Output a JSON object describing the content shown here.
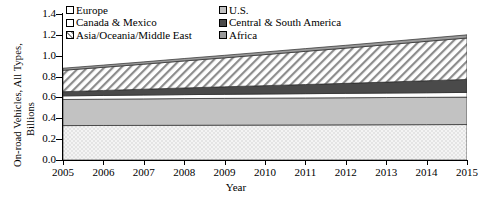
{
  "chart_data": {
    "type": "area",
    "title": "",
    "xlabel": "Year",
    "ylabel": "On-road Vehicles, All Types, Billions",
    "ylabel_line1": "On-road Vehicles, All Types,",
    "ylabel_line2": "Billions",
    "ylim": [
      0.0,
      1.4
    ],
    "yticks": [
      "0.0",
      "0.2",
      "0.4",
      "0.6",
      "0.8",
      "1.0",
      "1.2",
      "1.4"
    ],
    "ytick_values": [
      0.0,
      0.2,
      0.4,
      0.6,
      0.8,
      1.0,
      1.2,
      1.4
    ],
    "grid": false,
    "legend_position": "top-left-inside",
    "stacked": true,
    "categories": [
      2005,
      2006,
      2007,
      2008,
      2009,
      2010,
      2011,
      2012,
      2013,
      2014,
      2015
    ],
    "xtick_labels": [
      "2005",
      "2006",
      "2007",
      "2008",
      "2009",
      "2010",
      "2011",
      "2012",
      "2013",
      "2014",
      "2015"
    ],
    "series": [
      {
        "name": "Europe",
        "fill": "checkered-light",
        "color": "#f0f0f0",
        "values": [
          0.33,
          0.331,
          0.332,
          0.333,
          0.334,
          0.335,
          0.336,
          0.337,
          0.338,
          0.339,
          0.34
        ]
      },
      {
        "name": "U.S.",
        "fill": "solid-gray",
        "color": "#bdbdbd",
        "values": [
          0.25,
          0.252,
          0.254,
          0.256,
          0.257,
          0.258,
          0.259,
          0.26,
          0.261,
          0.262,
          0.263
        ]
      },
      {
        "name": "Canada & Mexico",
        "fill": "solid-white",
        "color": "#ffffff",
        "values": [
          0.035,
          0.036,
          0.037,
          0.038,
          0.039,
          0.04,
          0.041,
          0.042,
          0.043,
          0.044,
          0.045
        ]
      },
      {
        "name": "Central & South America",
        "fill": "solid-dark",
        "color": "#4a4a4a",
        "values": [
          0.04,
          0.048,
          0.056,
          0.064,
          0.072,
          0.08,
          0.088,
          0.096,
          0.105,
          0.115,
          0.125
        ]
      },
      {
        "name": "Asia/Oceania/Middle East",
        "fill": "diagonal-hatch",
        "color": "#ffffff",
        "values": [
          0.205,
          0.222,
          0.24,
          0.259,
          0.278,
          0.298,
          0.318,
          0.338,
          0.358,
          0.378,
          0.397
        ]
      },
      {
        "name": "Africa",
        "fill": "solid-midgray",
        "color": "#9a9a9a",
        "values": [
          0.02,
          0.021,
          0.022,
          0.023,
          0.024,
          0.025,
          0.026,
          0.027,
          0.028,
          0.029,
          0.03
        ]
      }
    ],
    "cumulative_top": {
      "europe": [
        0.33,
        0.331,
        0.332,
        0.333,
        0.334,
        0.335,
        0.336,
        0.337,
        0.338,
        0.339,
        0.34
      ],
      "us": [
        0.58,
        0.583,
        0.586,
        0.589,
        0.591,
        0.593,
        0.595,
        0.597,
        0.599,
        0.601,
        0.603
      ],
      "canada_mexico": [
        0.615,
        0.619,
        0.623,
        0.627,
        0.63,
        0.633,
        0.636,
        0.639,
        0.642,
        0.645,
        0.648
      ],
      "central_south_america": [
        0.655,
        0.667,
        0.679,
        0.691,
        0.702,
        0.713,
        0.724,
        0.735,
        0.747,
        0.76,
        0.773
      ],
      "asia_oceania_middle_east": [
        0.86,
        0.889,
        0.919,
        0.95,
        0.98,
        1.011,
        1.042,
        1.073,
        1.105,
        1.138,
        1.17
      ],
      "africa": [
        0.88,
        0.91,
        0.941,
        0.973,
        1.004,
        1.036,
        1.068,
        1.1,
        1.133,
        1.167,
        1.2
      ]
    }
  },
  "legend": {
    "column1": [
      {
        "label": "Europe"
      },
      {
        "label": "Canada & Mexico"
      },
      {
        "label": "Asia/Oceania/Middle East"
      }
    ],
    "column2": [
      {
        "label": "U.S."
      },
      {
        "label": "Central & South America"
      },
      {
        "label": "Africa"
      }
    ]
  }
}
